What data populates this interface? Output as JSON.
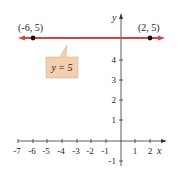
{
  "points": [
    {
      "label": "(-6, 5)",
      "x": -6,
      "y": 5
    },
    {
      "label": "(2, 5)",
      "x": 2,
      "y": 5
    }
  ],
  "line_label": "y = 5",
  "axes": {
    "x_label": "x",
    "y_label": "y",
    "x_ticks": [
      "-7",
      "-6",
      "-5",
      "-4",
      "-3",
      "-2",
      "-1",
      "1",
      "2"
    ],
    "y_ticks": [
      "4",
      "3",
      "2",
      "1",
      "-1"
    ]
  },
  "colors": {
    "line": "#d9443a",
    "callout": "#f2cfb0",
    "point": "#111111"
  }
}
